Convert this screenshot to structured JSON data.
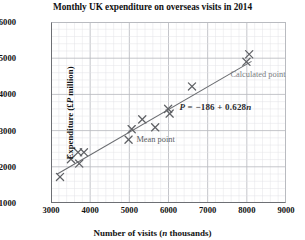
{
  "chart_data": {
    "type": "scatter",
    "title": "Monthly UK expenditure on overseas visits in 2014",
    "xlabel": "Number of visits (n thousands)",
    "xlabel_plain": "Number of visits (",
    "xlabel_italic": "n",
    "xlabel_tail": " thousands)",
    "ylabel": "Expenditure (£P million)",
    "ylabel_plain": "Expenditure (£",
    "ylabel_italic": "P",
    "ylabel_tail": " million)",
    "xlim": [
      3000,
      9000
    ],
    "ylim": [
      1000,
      6000
    ],
    "xticks": [
      3000,
      4000,
      5000,
      6000,
      7000,
      8000,
      9000
    ],
    "yticks": [
      1000,
      2000,
      3000,
      4000,
      5000,
      6000
    ],
    "x_minor_step": 200,
    "y_minor_step": 200,
    "grid": true,
    "legend": "none",
    "marker": "x-cross",
    "marker_color": "#5f6165",
    "line_color": "#6a6c70",
    "grid_major_color": "#b9bbc0",
    "grid_minor_color": "#e2e3e6",
    "axis_color": "#6d6f74",
    "points": [
      {
        "x": 3230,
        "y": 1720,
        "label": ""
      },
      {
        "x": 3510,
        "y": 2210,
        "label": ""
      },
      {
        "x": 3690,
        "y": 2400,
        "label": ""
      },
      {
        "x": 3720,
        "y": 2090,
        "label": ""
      },
      {
        "x": 3840,
        "y": 2400,
        "label": ""
      },
      {
        "x": 4980,
        "y": 2750,
        "label": ""
      },
      {
        "x": 5060,
        "y": 3040,
        "label": "mean"
      },
      {
        "x": 5330,
        "y": 3310,
        "label": ""
      },
      {
        "x": 5660,
        "y": 3090,
        "label": ""
      },
      {
        "x": 5990,
        "y": 3600,
        "label": ""
      },
      {
        "x": 6030,
        "y": 3470,
        "label": ""
      },
      {
        "x": 6600,
        "y": 4220,
        "label": ""
      },
      {
        "x": 7990,
        "y": 4900,
        "label": ""
      },
      {
        "x": 8060,
        "y": 5110,
        "label": "calculated"
      }
    ],
    "regression": {
      "equation": "P = −186 + 0.628n",
      "equation_lhs": "P",
      "equation_rhs": " = −186 + 0.628",
      "equation_var": "n",
      "intercept": -186,
      "slope": 0.628,
      "x_start": 3150,
      "x_end": 8120
    },
    "annotations": {
      "mean_point": "Mean point",
      "calculated_point": "Calculated point"
    }
  }
}
